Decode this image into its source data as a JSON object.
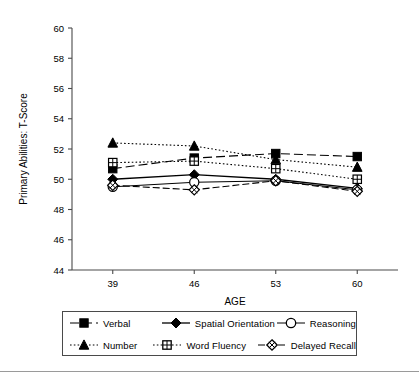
{
  "chart_data": {
    "type": "line",
    "title": "",
    "xlabel": "AGE",
    "ylabel": "Primary Abilities: T-Score",
    "x": [
      39,
      46,
      53,
      60
    ],
    "xtick_labels": [
      "39",
      "46",
      "53",
      "60"
    ],
    "ytick_labels": [
      "44",
      "46",
      "48",
      "50",
      "52",
      "54",
      "56",
      "58",
      "60"
    ],
    "yticks": [
      44,
      46,
      48,
      50,
      52,
      54,
      56,
      58,
      60
    ],
    "ylim": [
      44,
      60
    ],
    "xlim": [
      35.5,
      63.5
    ],
    "grid": false,
    "legend_position": "below-axes",
    "series": [
      {
        "name": "Verbal",
        "marker": "filled-square",
        "line": "dashed-long",
        "values": [
          50.7,
          51.4,
          51.7,
          51.5
        ]
      },
      {
        "name": "Spatial Orientation",
        "marker": "filled-diamond",
        "line": "solid",
        "values": [
          50.0,
          50.3,
          50.0,
          49.4
        ]
      },
      {
        "name": "Reasoning",
        "marker": "open-circle",
        "line": "solid-thin",
        "values": [
          49.5,
          49.8,
          49.9,
          49.3
        ]
      },
      {
        "name": "Number",
        "marker": "filled-triangle",
        "line": "dotted",
        "values": [
          52.4,
          52.2,
          51.3,
          50.8
        ]
      },
      {
        "name": "Word Fluency",
        "marker": "grid-square",
        "line": "dotted",
        "values": [
          51.1,
          51.2,
          50.7,
          50.0
        ]
      },
      {
        "name": "Delayed Recall",
        "marker": "crossed-diamond",
        "line": "dashed",
        "values": [
          49.6,
          49.3,
          49.9,
          49.2
        ]
      }
    ]
  },
  "axis": {
    "x_title": "AGE",
    "y_title": "Primary Abilities: T-Score"
  },
  "legend": {
    "items": [
      {
        "label": "Verbal",
        "icon": "filled-square-icon"
      },
      {
        "label": "Spatial Orientation",
        "icon": "filled-diamond-icon"
      },
      {
        "label": "Reasoning",
        "icon": "open-circle-icon"
      },
      {
        "label": "Number",
        "icon": "filled-triangle-icon"
      },
      {
        "label": "Word Fluency",
        "icon": "grid-square-icon"
      },
      {
        "label": "Delayed Recall",
        "icon": "crossed-diamond-icon"
      }
    ]
  },
  "colors": {
    "ink": "#000000",
    "axis": "#4a4a4a",
    "background": "#ffffff",
    "rule": "#9a9a9a"
  }
}
